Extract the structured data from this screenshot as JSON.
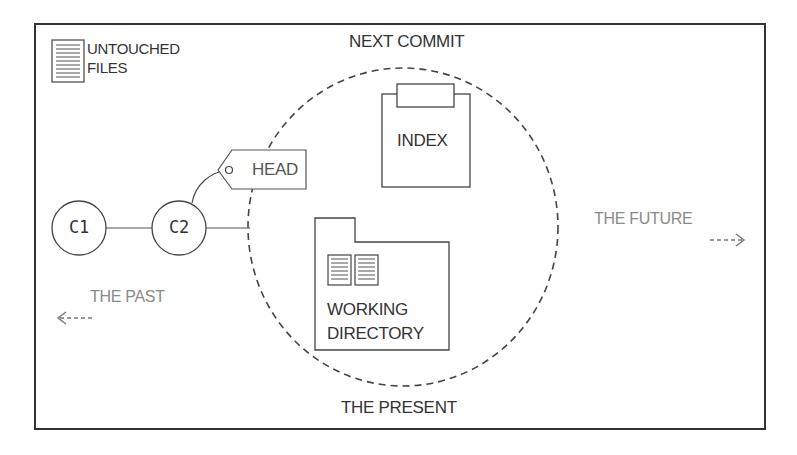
{
  "diagram": {
    "title_top": "NEXT COMMIT",
    "title_bottom": "THE PRESENT",
    "legend": {
      "icon": "document-icon",
      "line1": "UNTOUCHED",
      "line2": "FILES"
    },
    "commits": [
      {
        "label": "C1"
      },
      {
        "label": "C2"
      }
    ],
    "head": {
      "label": "HEAD"
    },
    "index": {
      "label": "INDEX"
    },
    "working_directory": {
      "line1": "WORKING",
      "line2": "DIRECTORY"
    },
    "past": {
      "label": "THE PAST",
      "arrow": "<---"
    },
    "future": {
      "label": "THE FUTURE",
      "arrow": "--->"
    },
    "colors": {
      "stroke": "#333333",
      "dim_text": "#8a8a8a",
      "background": "#ffffff"
    }
  }
}
